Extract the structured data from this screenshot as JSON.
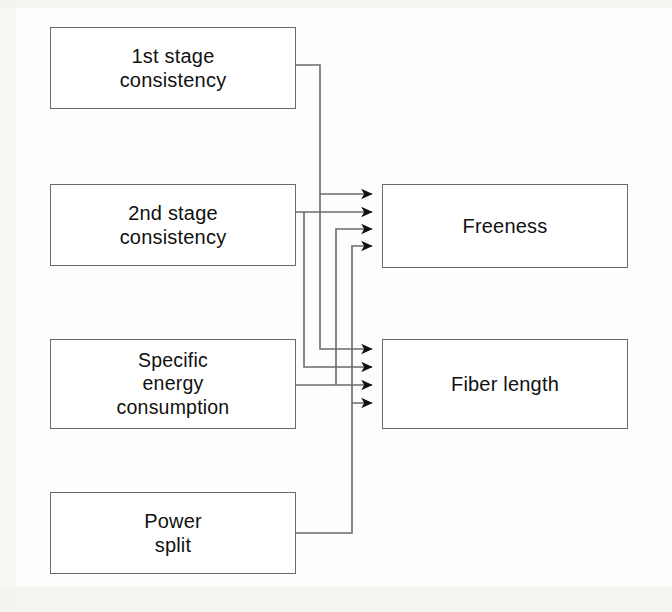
{
  "diagram": {
    "type": "block-flow",
    "colors": {
      "box_border": "#6b6b6b",
      "box_fill": "#ffffff",
      "wire": "#6b6b6b",
      "arrow": "#111111",
      "text": "#111111",
      "page_background": "#fdfdfc"
    },
    "inputs": [
      {
        "id": "first-stage-consistency",
        "label": "1st stage\nconsistency",
        "x": 50,
        "y": 27,
        "w": 246,
        "h": 82
      },
      {
        "id": "second-stage-consistency",
        "label": "2nd stage\nconsistency",
        "x": 50,
        "y": 184,
        "w": 246,
        "h": 82
      },
      {
        "id": "specific-energy-consumption",
        "label": "Specific\nenergy\nconsumption",
        "x": 50,
        "y": 339,
        "w": 246,
        "h": 90
      },
      {
        "id": "power-split",
        "label": "Power\nsplit",
        "x": 50,
        "y": 492,
        "w": 246,
        "h": 82
      }
    ],
    "outputs": [
      {
        "id": "freeness",
        "label": "Freeness",
        "x": 382,
        "y": 184,
        "w": 246,
        "h": 84
      },
      {
        "id": "fiber-length",
        "label": "Fiber length",
        "x": 382,
        "y": 339,
        "w": 246,
        "h": 90
      }
    ],
    "edges": [
      {
        "id": "edge-1st-stage-to-freeness",
        "from": "first-stage-consistency",
        "to": "freeness",
        "arrow_index": 1
      },
      {
        "id": "edge-2nd-stage-to-freeness",
        "from": "second-stage-consistency",
        "to": "freeness",
        "arrow_index": 2
      },
      {
        "id": "edge-sec-to-freeness",
        "from": "specific-energy-consumption",
        "to": "freeness",
        "arrow_index": 3
      },
      {
        "id": "edge-power-split-to-freeness",
        "from": "power-split",
        "to": "freeness",
        "arrow_index": 4
      },
      {
        "id": "edge-1st-stage-to-fiber",
        "from": "first-stage-consistency",
        "to": "fiber-length",
        "arrow_index": 1
      },
      {
        "id": "edge-2nd-stage-to-fiber",
        "from": "second-stage-consistency",
        "to": "fiber-length",
        "arrow_index": 2
      },
      {
        "id": "edge-sec-to-fiber",
        "from": "specific-energy-consumption",
        "to": "fiber-length",
        "arrow_index": 3
      },
      {
        "id": "edge-power-split-to-fiber",
        "from": "power-split",
        "to": "fiber-length",
        "arrow_index": 4
      }
    ],
    "arrow_targets": {
      "freeness": [
        194,
        212,
        229,
        246
      ],
      "fiber_length": [
        349,
        367,
        385,
        403
      ]
    }
  }
}
